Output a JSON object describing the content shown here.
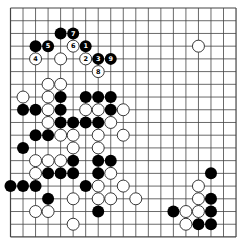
{
  "board": {
    "size": 19,
    "origin_x": 10.5,
    "origin_y": 8,
    "spacing_x": 12.53,
    "spacing_y": 12.72,
    "stone_radius": 6,
    "line_color": "#444444",
    "black_color": "#000000",
    "white_fill": "#ffffff",
    "white_stroke": "#222222"
  },
  "stones": {
    "black": [
      {
        "c": 4,
        "r": 2
      },
      {
        "c": 5,
        "r": 2,
        "label": "7"
      },
      {
        "c": 2,
        "r": 3
      },
      {
        "c": 3,
        "r": 3,
        "label": "5"
      },
      {
        "c": 6,
        "r": 3,
        "label": "1"
      },
      {
        "c": 7,
        "r": 4,
        "label": "3"
      },
      {
        "c": 8,
        "r": 4,
        "label": "9"
      },
      {
        "c": 4,
        "r": 7
      },
      {
        "c": 6,
        "r": 7
      },
      {
        "c": 7,
        "r": 7
      },
      {
        "c": 8,
        "r": 7
      },
      {
        "c": 1,
        "r": 8
      },
      {
        "c": 2,
        "r": 8
      },
      {
        "c": 4,
        "r": 8
      },
      {
        "c": 8,
        "r": 8
      },
      {
        "c": 4,
        "r": 9
      },
      {
        "c": 5,
        "r": 9
      },
      {
        "c": 6,
        "r": 9
      },
      {
        "c": 7,
        "r": 9
      },
      {
        "c": 2,
        "r": 10
      },
      {
        "c": 3,
        "r": 10
      },
      {
        "c": 1,
        "r": 11
      },
      {
        "c": 5,
        "r": 12
      },
      {
        "c": 7,
        "r": 12
      },
      {
        "c": 8,
        "r": 12
      },
      {
        "c": 3,
        "r": 13
      },
      {
        "c": 4,
        "r": 13
      },
      {
        "c": 5,
        "r": 13
      },
      {
        "c": 7,
        "r": 13
      },
      {
        "c": 16,
        "r": 13
      },
      {
        "c": 0,
        "r": 14
      },
      {
        "c": 1,
        "r": 14
      },
      {
        "c": 2,
        "r": 14
      },
      {
        "c": 6,
        "r": 14
      },
      {
        "c": 3,
        "r": 15
      },
      {
        "c": 16,
        "r": 15
      },
      {
        "c": 7,
        "r": 16
      },
      {
        "c": 13,
        "r": 16
      },
      {
        "c": 16,
        "r": 16
      },
      {
        "c": 15,
        "r": 17
      },
      {
        "c": 16,
        "r": 17
      }
    ],
    "white": [
      {
        "c": 5,
        "r": 3,
        "label": "6"
      },
      {
        "c": 15,
        "r": 3
      },
      {
        "c": 2,
        "r": 4,
        "label": "4"
      },
      {
        "c": 4,
        "r": 4
      },
      {
        "c": 6,
        "r": 4,
        "label": "2"
      },
      {
        "c": 7,
        "r": 5,
        "label": "8"
      },
      {
        "c": 3,
        "r": 6
      },
      {
        "c": 4,
        "r": 6
      },
      {
        "c": 1,
        "r": 7
      },
      {
        "c": 3,
        "r": 7
      },
      {
        "c": 3,
        "r": 8
      },
      {
        "c": 6,
        "r": 8
      },
      {
        "c": 7,
        "r": 8
      },
      {
        "c": 9,
        "r": 8
      },
      {
        "c": 3,
        "r": 9
      },
      {
        "c": 8,
        "r": 9
      },
      {
        "c": 4,
        "r": 10
      },
      {
        "c": 5,
        "r": 10
      },
      {
        "c": 7,
        "r": 10
      },
      {
        "c": 9,
        "r": 10
      },
      {
        "c": 5,
        "r": 11
      },
      {
        "c": 7,
        "r": 11
      },
      {
        "c": 2,
        "r": 12
      },
      {
        "c": 3,
        "r": 12
      },
      {
        "c": 4,
        "r": 12
      },
      {
        "c": 2,
        "r": 13
      },
      {
        "c": 8,
        "r": 13
      },
      {
        "c": 7,
        "r": 14
      },
      {
        "c": 9,
        "r": 14
      },
      {
        "c": 15,
        "r": 14
      },
      {
        "c": 5,
        "r": 15
      },
      {
        "c": 7,
        "r": 15
      },
      {
        "c": 8,
        "r": 15
      },
      {
        "c": 10,
        "r": 15
      },
      {
        "c": 15,
        "r": 15
      },
      {
        "c": 2,
        "r": 16
      },
      {
        "c": 3,
        "r": 16
      },
      {
        "c": 14,
        "r": 16
      },
      {
        "c": 15,
        "r": 16
      },
      {
        "c": 5,
        "r": 17
      },
      {
        "c": 14,
        "r": 17
      }
    ]
  }
}
